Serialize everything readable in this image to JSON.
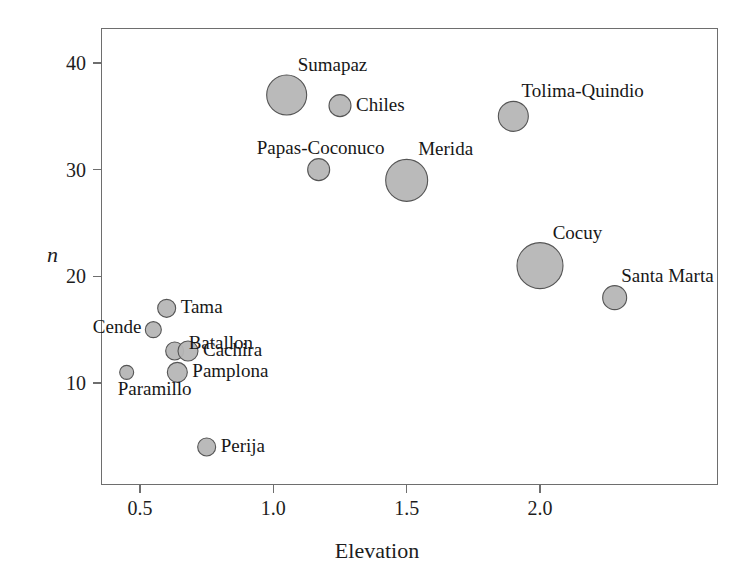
{
  "chart_data": {
    "type": "scatter",
    "title": "",
    "xlabel": "Elevation",
    "ylabel": "n",
    "xlim": [
      0.33,
      2.65
    ],
    "ylim": [
      1.5,
      42.5
    ],
    "grid": false,
    "legend": "none",
    "xticks": [
      0.5,
      1.0,
      1.5,
      2.0
    ],
    "xticklabels": [
      "0.5",
      "1.0",
      "1.5",
      "2.0"
    ],
    "yticks": [
      10,
      20,
      30,
      40
    ],
    "yticklabels": [
      "10",
      "20",
      "30",
      "40"
    ],
    "marker_fill": "#b6b6b6",
    "marker_edge": "#555555",
    "points": [
      {
        "label": "Sumapaz",
        "x": 1.05,
        "y": 37,
        "r": 20,
        "label_pos": "above-right"
      },
      {
        "label": "Chiles",
        "x": 1.25,
        "y": 36,
        "r": 11,
        "label_pos": "right"
      },
      {
        "label": "Tolima-Quindio",
        "x": 1.9,
        "y": 35,
        "r": 15,
        "label_pos": "above-right"
      },
      {
        "label": "Papas-Coconuco",
        "x": 1.17,
        "y": 30,
        "r": 11,
        "label_pos": "above"
      },
      {
        "label": "Merida",
        "x": 1.5,
        "y": 29,
        "r": 21,
        "label_pos": "above-right"
      },
      {
        "label": "Cocuy",
        "x": 2.0,
        "y": 21,
        "r": 23,
        "label_pos": "above-right"
      },
      {
        "label": "Santa Marta",
        "x": 2.28,
        "y": 18,
        "r": 12,
        "label_pos": "above-right"
      },
      {
        "label": "Tama",
        "x": 0.6,
        "y": 17,
        "r": 9,
        "label_pos": "right"
      },
      {
        "label": "Cende",
        "x": 0.55,
        "y": 15,
        "r": 8,
        "label_pos": "left-up"
      },
      {
        "label": "Batallon",
        "x": 0.63,
        "y": 13,
        "r": 9,
        "label_pos": "right-up"
      },
      {
        "label": "Cachira",
        "x": 0.68,
        "y": 13,
        "r": 10,
        "label_pos": "right"
      },
      {
        "label": "Pamplona",
        "x": 0.64,
        "y": 11,
        "r": 10,
        "label_pos": "right"
      },
      {
        "label": "Paramillo",
        "x": 0.45,
        "y": 11,
        "r": 7,
        "label_pos": "below-left"
      },
      {
        "label": "Perija",
        "x": 0.75,
        "y": 4,
        "r": 9,
        "label_pos": "right"
      }
    ]
  },
  "axes": {
    "x_title": "Elevation",
    "y_title": "n"
  }
}
